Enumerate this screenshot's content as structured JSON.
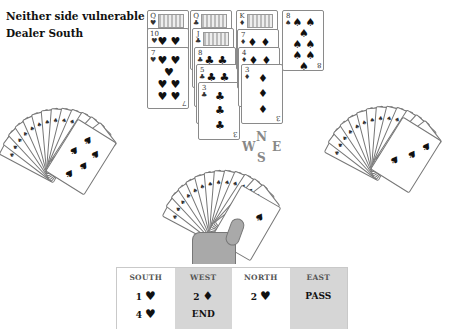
{
  "info": {
    "vulnerability": "Neither side vulnerable",
    "dealer": "Dealer South"
  },
  "dummy": {
    "position": "North",
    "columns": [
      {
        "suit": "hearts",
        "symbol": "♥",
        "cards": [
          "Q",
          "10",
          "7"
        ]
      },
      {
        "suit": "clubs",
        "symbol": "♣",
        "cards": [
          "Q",
          "J",
          "8",
          "5",
          "3"
        ]
      },
      {
        "suit": "diamonds",
        "symbol": "♦",
        "cards": [
          "K",
          "7",
          "4",
          "3"
        ]
      },
      {
        "suit": "spades",
        "symbol": "♠",
        "cards": [
          "8"
        ]
      }
    ]
  },
  "compass": {
    "n": "N",
    "w": "W",
    "e": "E",
    "s": "S"
  },
  "hands": {
    "west": {
      "label": "West hand (face-down fan)",
      "count": 13,
      "top_card": "10♠"
    },
    "east": {
      "label": "East hand (face-down fan)",
      "count": 13,
      "top_card": "3♠"
    },
    "south": {
      "label": "South hand (held fan)",
      "count": 13,
      "top_card": "2♠"
    }
  },
  "bidding": {
    "columns": [
      {
        "header": "SOUTH",
        "shade": "white",
        "bids": [
          {
            "level": "1",
            "suit": "♥"
          },
          {
            "level": "4",
            "suit": "♥"
          }
        ]
      },
      {
        "header": "WEST",
        "shade": "grey",
        "bids": [
          {
            "level": "2",
            "suit": "♦"
          },
          {
            "level": "END",
            "suit": ""
          }
        ]
      },
      {
        "header": "NORTH",
        "shade": "white",
        "bids": [
          {
            "level": "2",
            "suit": "♥"
          }
        ]
      },
      {
        "header": "EAST",
        "shade": "grey",
        "bids": [
          {
            "level": "PASS",
            "suit": ""
          }
        ]
      }
    ]
  },
  "colors": {
    "background": "#ffffff",
    "table_grey": "#d6d6d6",
    "compass": "#888888",
    "hand": "#a9a9a9"
  }
}
